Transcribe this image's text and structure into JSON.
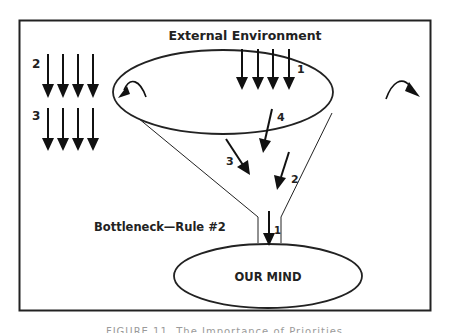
{
  "diagram": {
    "title": "External Environment",
    "bottleneck_label": "Bottleneck—Rule #2",
    "mind_label": "OUR MIND",
    "arrow_groups": [
      {
        "label": "2",
        "count": 4,
        "position": "left-top"
      },
      {
        "label": "3",
        "count": 4,
        "position": "left-bottom"
      },
      {
        "label": "1",
        "count": 4,
        "position": "inside-funnel-top"
      }
    ],
    "funnel_arrows": [
      {
        "label": "4"
      },
      {
        "label": "3"
      },
      {
        "label": "2"
      },
      {
        "label": "1",
        "position": "bottleneck"
      }
    ],
    "overflow_arrows": [
      "left",
      "right"
    ]
  },
  "caption": "FIGURE 11. The Importance of Priorities"
}
